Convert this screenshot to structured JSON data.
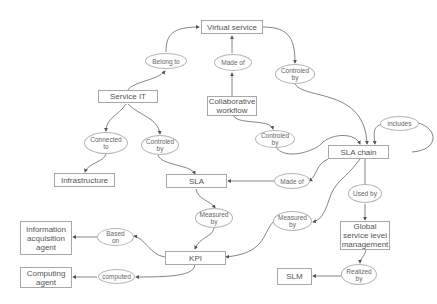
{
  "diagram": {
    "type": "concept-map",
    "concepts": {
      "virtual_service": "Virtual service",
      "service_it": "Service IT",
      "collaborative_workflow": "Collaborative\nworkflow",
      "sla_chain": "SLA chain",
      "infrastructure": "Infrastructure",
      "sla": "SLA",
      "info_agent": "Information\nacquisition\nagent",
      "kpi": "KPI",
      "global_slm": "Global\nservice level\nmanagement",
      "computing_agent": "Computing\nagent",
      "slm": "SLM"
    },
    "relations": {
      "belong_to": "Belong to",
      "made_of_1": "Made of",
      "controled_by_1": "Controled\nby",
      "connected_to": "Connected\nto",
      "controled_by_2": "Controled\nby",
      "controled_by_3": "Controled\nby",
      "includes": "includes",
      "made_of_2": "Made of",
      "used_by": "Used by",
      "measured_by_1": "Measured\nby",
      "measured_by_2": "Measured\nby",
      "based_on": "Based\non",
      "computed": "computed",
      "realized_by": "Realized\nby"
    },
    "edges": [
      [
        "Service IT",
        "Belong to",
        "Virtual service"
      ],
      [
        "Collaborative workflow",
        "Made of",
        "Virtual service"
      ],
      [
        "Virtual service",
        "Controled by",
        "SLA chain"
      ],
      [
        "Service IT",
        "Connected to",
        "Infrastructure"
      ],
      [
        "Service IT",
        "Controled by",
        "SLA"
      ],
      [
        "Collaborative workflow",
        "Controled by",
        "SLA chain"
      ],
      [
        "SLA chain",
        "includes",
        "SLA chain"
      ],
      [
        "SLA chain",
        "Made of",
        "SLA"
      ],
      [
        "SLA chain",
        "Used by",
        "Global service level management"
      ],
      [
        "SLA",
        "Measured by",
        "KPI"
      ],
      [
        "SLA chain",
        "Measured by",
        "KPI"
      ],
      [
        "KPI",
        "Based on",
        "Information acquisition agent"
      ],
      [
        "KPI",
        "computed",
        "Computing agent"
      ],
      [
        "Global service level management",
        "Realized by",
        "SLM"
      ]
    ]
  }
}
